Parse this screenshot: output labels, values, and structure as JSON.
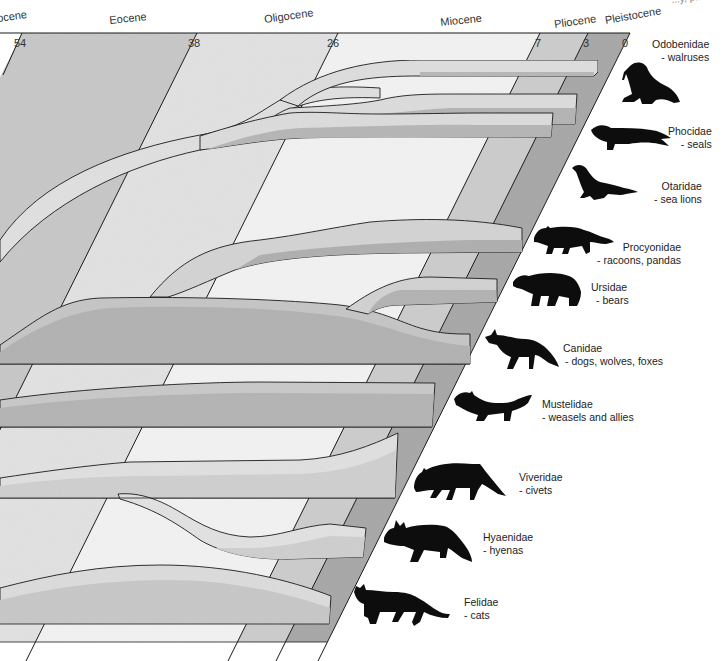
{
  "diagram": {
    "type": "phylogenetic-tree",
    "colors": {
      "paleocene_strip": "#d8d8d8",
      "eocene_strip": "#c4c4c4",
      "oligocene_strip": "#e4e4e4",
      "miocene_strip": "#f0f0f0",
      "pliocene_strip": "#c8c8c8",
      "pleistocene_strip": "#a6a6a6",
      "branch_top": "#e2e2e2",
      "branch_side": "#b4b4b4",
      "outline": "#1a1a1a",
      "silhouette": "#0d0d0d"
    },
    "top_right_fragment": "...y, p..."
  },
  "timeline": {
    "epochs": [
      {
        "name": "Paleocene",
        "visible_text": "ocene"
      },
      {
        "name": "Eocene",
        "visible_text": "Eocene"
      },
      {
        "name": "Oligocene",
        "visible_text": "Oligocene"
      },
      {
        "name": "Miocene",
        "visible_text": "Miocene"
      },
      {
        "name": "Pliocene",
        "visible_text": "Pliocene"
      },
      {
        "name": "Pleistocene",
        "visible_text": "Pleistocene"
      }
    ],
    "ticks_mya": [
      "54",
      "38",
      "26",
      "7",
      "3",
      "0"
    ]
  },
  "families": [
    {
      "name": "Odobenidae",
      "common": "- walruses",
      "silhouette": "walrus-icon"
    },
    {
      "name": "Phocidae",
      "common": "- seals",
      "silhouette": "seal-icon"
    },
    {
      "name": "Otaridae",
      "common": "- sea lions",
      "silhouette": "sea-lion-icon"
    },
    {
      "name": "Procyonidae",
      "common": "- racoons, pandas",
      "silhouette": "raccoon-icon"
    },
    {
      "name": "Ursidae",
      "common": "- bears",
      "silhouette": "bear-icon"
    },
    {
      "name": "Canidae",
      "common": "- dogs, wolves, foxes",
      "silhouette": "fox-icon"
    },
    {
      "name": "Mustelidae",
      "common": "- weasels and allies",
      "silhouette": "weasel-icon"
    },
    {
      "name": "Viveridae",
      "common": "- civets",
      "silhouette": "civet-icon"
    },
    {
      "name": "Hyaenidae",
      "common": "- hyenas",
      "silhouette": "hyena-icon"
    },
    {
      "name": "Felidae",
      "common": "- cats",
      "silhouette": "cat-icon"
    }
  ],
  "tree_structure": {
    "clades": [
      {
        "members": [
          "Odobenidae",
          "Phocidae",
          "Otaridae"
        ],
        "note": "pinnipeds diverge from a common stem in the Oligocene"
      },
      {
        "members": [
          "Procyonidae",
          "Ursidae",
          "Canidae"
        ],
        "note": "branch from a broad stem; Ursidae splits late Miocene"
      },
      {
        "members": [
          "Mustelidae"
        ],
        "note": "separate lineage from Paleocene/Eocene"
      },
      {
        "members": [
          "Viveridae",
          "Hyaenidae"
        ],
        "note": "Hyaenidae branches from Viveridae in the Oligocene"
      },
      {
        "members": [
          "Felidae"
        ],
        "note": "separate lineage"
      }
    ]
  }
}
